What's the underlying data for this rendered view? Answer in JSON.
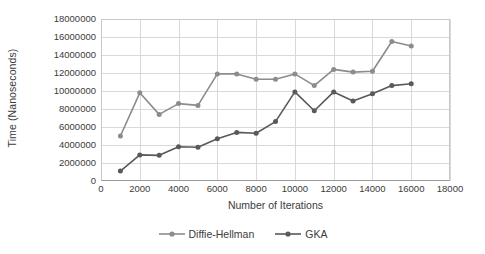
{
  "chart_data": {
    "type": "line",
    "title": "",
    "xlabel": "Number of Iterations",
    "ylabel": "Time (Nanoseconds)",
    "xlim": [
      0,
      18000
    ],
    "ylim": [
      0,
      18000000
    ],
    "grid": true,
    "legend_position": "bottom",
    "x": [
      1000,
      2000,
      3000,
      4000,
      5000,
      6000,
      7000,
      8000,
      9000,
      10000,
      11000,
      12000,
      13000,
      14000,
      15000,
      16000
    ],
    "xticks": [
      "0",
      "2000",
      "4000",
      "6000",
      "8000",
      "10000",
      "12000",
      "14000",
      "16000",
      "18000"
    ],
    "xtick_values": [
      0,
      2000,
      4000,
      6000,
      8000,
      10000,
      12000,
      14000,
      16000,
      18000
    ],
    "yticks": [
      "0",
      "2000000",
      "4000000",
      "6000000",
      "8000000",
      "10000000",
      "12000000",
      "14000000",
      "16000000",
      "18000000"
    ],
    "ytick_values": [
      0,
      2000000,
      4000000,
      6000000,
      8000000,
      10000000,
      12000000,
      14000000,
      16000000,
      18000000
    ],
    "series": [
      {
        "name": "Diffie-Hellman",
        "color": "#8c8c8c",
        "marker": "circle",
        "values": [
          5000000,
          9800000,
          7400000,
          8600000,
          8400000,
          11900000,
          11900000,
          11300000,
          11300000,
          11900000,
          10600000,
          12400000,
          12100000,
          12200000,
          15500000,
          15000000
        ]
      },
      {
        "name": "GKA",
        "color": "#595959",
        "marker": "circle",
        "values": [
          1100000,
          2900000,
          2850000,
          3800000,
          3750000,
          4700000,
          5400000,
          5300000,
          6600000,
          9900000,
          7800000,
          9900000,
          8900000,
          9700000,
          10600000,
          10800000
        ]
      }
    ]
  },
  "legend": {
    "items": [
      {
        "label": "Diffie-Hellman",
        "color": "#8c8c8c"
      },
      {
        "label": "GKA",
        "color": "#595959"
      }
    ]
  },
  "colors": {
    "diffie_hellman": "#8c8c8c",
    "gka": "#595959",
    "gridline": "#d9d9d9",
    "axis": "#9a9a9a",
    "text": "#3b3b3b",
    "background": "#ffffff"
  }
}
